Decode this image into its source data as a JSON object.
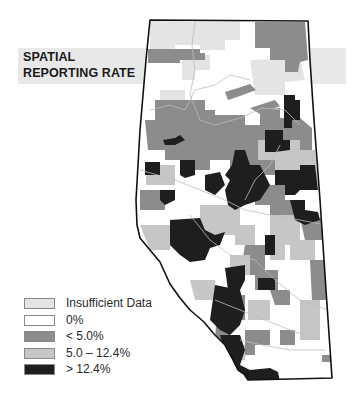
{
  "title": {
    "line1": "SPATIAL",
    "line2": "REPORTING RATE"
  },
  "colors": {
    "insufficient": "#e4e4e4",
    "zero": "#ffffff",
    "low": "#8c8c8c",
    "mid": "#c6c6c6",
    "high": "#1e1e1e",
    "outline": "#111111",
    "band": "#e8e8e8"
  },
  "legend": {
    "items": [
      {
        "label": "Insufficient Data",
        "color": "#e4e4e4"
      },
      {
        "label": "0%",
        "color": "#ffffff"
      },
      {
        "label": "< 5.0%",
        "color": "#8c8c8c"
      },
      {
        "label": "5.0 – 12.4%",
        "color": "#c6c6c6"
      },
      {
        "label": "> 12.4%",
        "color": "#1e1e1e"
      }
    ]
  }
}
